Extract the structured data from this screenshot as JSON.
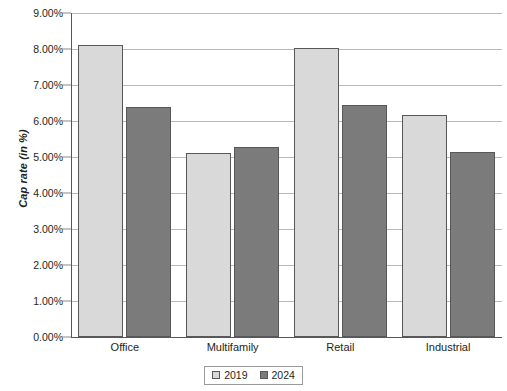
{
  "chart_data": {
    "type": "bar",
    "title": "",
    "xlabel": "",
    "ylabel": "Cap rate (in %)",
    "categories": [
      "Office",
      "Multifamily",
      "Retail",
      "Industrial"
    ],
    "series": [
      {
        "name": "2019",
        "color": "#d9d9d9",
        "values": [
          8.1,
          5.1,
          8.03,
          6.16
        ]
      },
      {
        "name": "2024",
        "color": "#7b7b7b",
        "values": [
          6.4,
          5.27,
          6.44,
          5.15
        ]
      }
    ],
    "ylim": [
      0,
      9
    ],
    "ytick_values": [
      0,
      1,
      2,
      3,
      4,
      5,
      6,
      7,
      8,
      9
    ],
    "ytick_labels": [
      "0.00%",
      "1.00%",
      "2.00%",
      "3.00%",
      "4.00%",
      "5.00%",
      "6.00%",
      "7.00%",
      "8.00%",
      "9.00%"
    ],
    "grid": true,
    "legend_position": "bottom",
    "legend_entries": [
      "2019",
      "2024"
    ],
    "value_suffix": "%"
  }
}
